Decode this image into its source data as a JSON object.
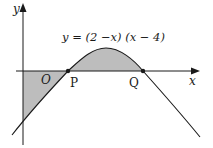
{
  "diagram": {
    "equation": "y = (2 −x) (x − 4)",
    "axis_labels": {
      "x": "x",
      "y": "y"
    },
    "origin_label": "O",
    "points": [
      {
        "label": "P",
        "x": 2,
        "y": 0
      },
      {
        "label": "Q",
        "x": 4,
        "y": 0
      }
    ],
    "colors": {
      "curve": "#1a1a1a",
      "shade": "#bdbdbd",
      "axes": "#1a1a1a"
    }
  }
}
